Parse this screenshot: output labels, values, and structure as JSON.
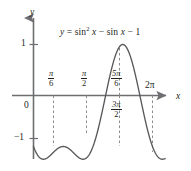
{
  "figure": {
    "kind": "cartesian-graph",
    "background_color": "#ffffff",
    "ink_color": "#231f20",
    "axis_color": "#6d6e71",
    "curve_color": "#58595b",
    "dash_color": "#808285",
    "equation_label": "y = sin² x − sin x − 1",
    "equation_parts": {
      "lhs": "y",
      "equals": "=",
      "sin_base": "sin",
      "exponent": "2",
      "var1": "x",
      "minus1": "−",
      "sin2": "sin",
      "var2": "x",
      "minus2": "−",
      "const": "1"
    },
    "axes": {
      "x_axis_name": "x",
      "y_axis_name": "y",
      "origin_label": "0"
    },
    "y_ticks": [
      {
        "label": "1",
        "value": 1
      },
      {
        "label": "−1",
        "value": -1
      }
    ],
    "x_ticks_above": [
      {
        "num": "π",
        "den": "6",
        "value": 0.5236,
        "label": "π/6"
      },
      {
        "num": "π",
        "den": "2",
        "value": 1.5708,
        "label": "π/2"
      },
      {
        "num": "5π",
        "den": "6",
        "value": 2.618,
        "label": "5π/6"
      }
    ],
    "x_ticks_below": [
      {
        "num": "3π",
        "den": "2",
        "value": 4.7124,
        "label": "3π/2"
      }
    ],
    "x_ticks_plain": [
      {
        "label": "2π",
        "value": 6.2832
      }
    ]
  },
  "chart_data": {
    "type": "line",
    "xlabel": "x",
    "ylabel": "y",
    "xlim": [
      -0.35,
      6.95
    ],
    "ylim": [
      -1.75,
      1.35
    ],
    "grid": false,
    "legend": null,
    "function": "y = sin(x)^2 - sin(x) - 1",
    "x_tick_values": [
      0.5236,
      1.5708,
      2.618,
      4.7124,
      6.2832
    ],
    "x_tick_labels": [
      "π/6",
      "π/2",
      "5π/6",
      "3π/2",
      "2π"
    ],
    "y_tick_values": [
      1,
      -1
    ],
    "y_tick_labels": [
      "1",
      "−1"
    ],
    "dashed_guides_x": [
      0.5236,
      1.5708,
      2.618,
      4.7124,
      6.2832
    ],
    "key_points": [
      {
        "x": 0.0,
        "y": -1.0,
        "note": "start at y=-1"
      },
      {
        "x": 0.5236,
        "y": -1.25,
        "note": "local minimum"
      },
      {
        "x": 1.5708,
        "y": -1.0,
        "note": "local maximum between dips"
      },
      {
        "x": 2.618,
        "y": -1.25,
        "note": "local minimum"
      },
      {
        "x": 3.1416,
        "y": -1.0,
        "note": "crossing back through -1"
      },
      {
        "x": 3.6652,
        "y": -0.25,
        "note": "rising"
      },
      {
        "x": 3.8713,
        "y": 0.0,
        "note": "x-intercept"
      },
      {
        "x": 4.7124,
        "y": 1.0,
        "note": "absolute maximum"
      },
      {
        "x": 5.5535,
        "y": 0.0,
        "note": "x-intercept"
      },
      {
        "x": 6.2832,
        "y": -1.0,
        "note": "value at 2π"
      },
      {
        "x": 6.75,
        "y": -1.42,
        "note": "curve continues past 2π"
      }
    ],
    "series": [
      {
        "name": "y = sin² x − sin x − 1",
        "x": [
          0.0,
          0.2,
          0.4,
          0.5236,
          0.7,
          0.9,
          1.1,
          1.3,
          1.5708,
          1.8,
          2.0,
          2.2,
          2.4,
          2.618,
          2.8,
          3.0,
          3.1416,
          3.3,
          3.5,
          3.7,
          3.8713,
          4.0,
          4.2,
          4.4,
          4.7124,
          5.0,
          5.2,
          5.4,
          5.5535,
          5.8,
          6.0,
          6.2832,
          6.5,
          6.75
        ],
        "y": [
          -1.0,
          -1.159,
          -1.237,
          -1.25,
          -1.232,
          -1.171,
          -1.107,
          -1.05,
          -1.0,
          -1.026,
          -1.136,
          -1.215,
          -1.247,
          -1.25,
          -1.219,
          -1.121,
          -1.0,
          -0.8,
          -0.452,
          -0.093,
          0.0,
          0.186,
          0.567,
          0.835,
          1.0,
          0.901,
          0.704,
          0.393,
          0.0,
          -0.597,
          -0.919,
          -1.0,
          -1.225,
          -1.42
        ]
      }
    ]
  }
}
